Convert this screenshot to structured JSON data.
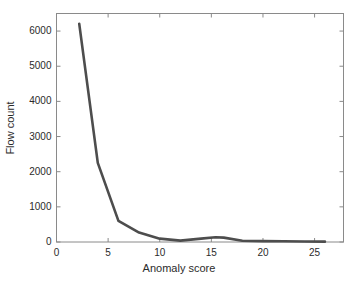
{
  "chart_data": {
    "type": "line",
    "title": "",
    "xlabel": "Anomaly score",
    "ylabel": "Flow count",
    "xlim": [
      0,
      27.8
    ],
    "ylim": [
      0,
      6500
    ],
    "xticks": [
      0,
      5,
      10,
      15,
      20,
      25
    ],
    "yticks": [
      0,
      1000,
      2000,
      3000,
      4000,
      5000,
      6000
    ],
    "xtick_labels": [
      "0",
      "5",
      "10",
      "15",
      "20",
      "25"
    ],
    "ytick_labels": [
      "0",
      "1000",
      "2000",
      "3000",
      "4000",
      "5000",
      "6000"
    ],
    "grid": false,
    "legend": null,
    "line_color": "#4d4d4d",
    "line_width": 2.6,
    "axis_color": "#8a8a8a",
    "background": "#ffffff",
    "series": [
      {
        "name": "Flow count",
        "x": [
          2.2,
          4.0,
          6.0,
          8.0,
          10.0,
          12.0,
          14.0,
          15.4,
          16.2,
          18.0,
          20.0,
          22.0,
          24.0,
          26.0
        ],
        "values": [
          6210,
          2250,
          600,
          270,
          95,
          40,
          95,
          135,
          125,
          35,
          25,
          20,
          15,
          10
        ]
      }
    ]
  }
}
